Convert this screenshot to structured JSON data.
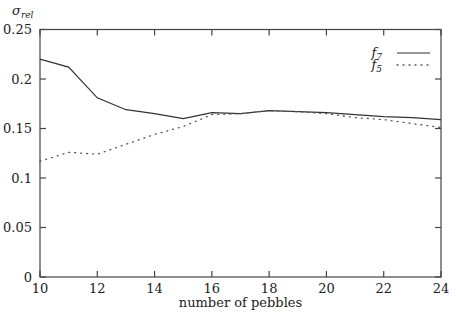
{
  "chart_data": {
    "type": "line",
    "title": "",
    "xlabel": "number of pebbles",
    "ylabel": "σ_rel",
    "ylabel_main": "σ",
    "ylabel_sub": "rel",
    "xlim": [
      10,
      24
    ],
    "ylim": [
      0,
      0.25
    ],
    "grid": false,
    "legend_position": "upper right",
    "x_ticks": [
      10,
      12,
      14,
      16,
      18,
      20,
      22,
      24
    ],
    "x_tick_labels": [
      "10",
      "12",
      "14",
      "16",
      "18",
      "20",
      "22",
      "24"
    ],
    "y_ticks": [
      0,
      0.05,
      0.1,
      0.15,
      0.2,
      0.25
    ],
    "y_tick_labels": [
      "0",
      "0.05",
      "0.1",
      "0.15",
      "0.2",
      "0.25"
    ],
    "x": [
      10,
      11,
      12,
      13,
      14,
      15,
      16,
      17,
      18,
      19,
      20,
      21,
      22,
      23,
      24
    ],
    "series": [
      {
        "name": "f7",
        "label_main": "f",
        "label_sub": "7",
        "style": "solid",
        "color": "#333333",
        "values": [
          0.22,
          0.212,
          0.181,
          0.169,
          0.165,
          0.16,
          0.166,
          0.165,
          0.168,
          0.167,
          0.166,
          0.164,
          0.162,
          0.161,
          0.159
        ]
      },
      {
        "name": "f5",
        "label_main": "f",
        "label_sub": "5",
        "style": "dotted",
        "color": "#555555",
        "values": [
          0.117,
          0.126,
          0.124,
          0.134,
          0.144,
          0.152,
          0.164,
          0.165,
          0.168,
          0.167,
          0.165,
          0.161,
          0.159,
          0.155,
          0.151
        ]
      }
    ]
  }
}
